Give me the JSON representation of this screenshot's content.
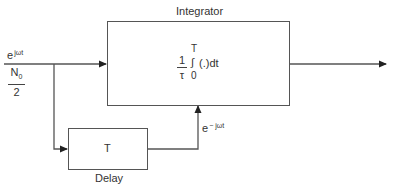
{
  "diagram": {
    "input": {
      "signal_base": "e",
      "signal_exp": "jωt",
      "noise_num_base": "N",
      "noise_num_sub": "0",
      "noise_den": "2"
    },
    "integrator": {
      "title": "Integrator",
      "coef_num": "1",
      "coef_den": "τ",
      "upper_limit": "T",
      "integral_sign": "∫",
      "lower_limit": "0",
      "integrand": "(.)dt"
    },
    "delay": {
      "value": "T",
      "label": "Delay"
    },
    "feedback": {
      "signal_base": "e",
      "signal_exp": "− jωt"
    },
    "colors": {
      "line": "#555555",
      "text": "#333333"
    }
  }
}
